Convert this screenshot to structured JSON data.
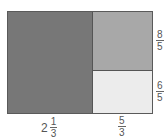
{
  "diagram": {
    "type": "area-model-rectangle",
    "regions": [
      {
        "name": "left",
        "fill": "#777777"
      },
      {
        "name": "top-right",
        "fill": "#a8a8a8"
      },
      {
        "name": "bottom-right",
        "fill": "#ececec"
      }
    ],
    "labels": {
      "bottom_left": {
        "whole": "2",
        "numerator": "1",
        "denominator": "3"
      },
      "bottom_right": {
        "numerator": "5",
        "denominator": "3"
      },
      "right_top": {
        "numerator": "8",
        "denominator": "5"
      },
      "right_bottom": {
        "numerator": "6",
        "denominator": "5"
      }
    }
  }
}
